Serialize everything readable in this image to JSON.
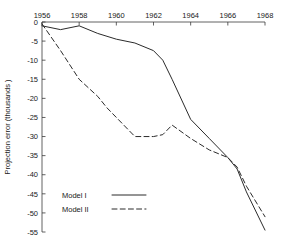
{
  "chart_data": {
    "type": "line",
    "title": "",
    "xlabel": "",
    "ylabel": "Projection  error  (thousands )",
    "xlim": [
      1956,
      1968
    ],
    "ylim": [
      -55,
      0
    ],
    "x_ticks": [
      1956,
      1958,
      1960,
      1962,
      1964,
      1966,
      1968
    ],
    "y_ticks": [
      0,
      -5,
      -10,
      -15,
      -20,
      -25,
      -30,
      -35,
      -40,
      -45,
      -50,
      -55
    ],
    "x_tick_labels": [
      "1956",
      "1958",
      "1960",
      "1962",
      "1964",
      "1966",
      "1968"
    ],
    "y_tick_labels": [
      "0",
      "-5",
      "-10",
      "-15",
      "-20",
      "-25",
      "-30",
      "-35",
      "-40",
      "-45",
      "-50",
      "-55"
    ],
    "grid": false,
    "x_axis_position": "top",
    "legend_position": "lower-left-inside",
    "series": [
      {
        "name": "Model I",
        "style": "solid",
        "color": "#2b2b2b",
        "x": [
          1956,
          1957,
          1958,
          1959,
          1960,
          1961,
          1962,
          1962.5,
          1963,
          1964,
          1965,
          1966,
          1966.5,
          1967,
          1968
        ],
        "values": [
          -1.0,
          -2.0,
          -1.0,
          -3.0,
          -4.5,
          -5.5,
          -7.5,
          -10.0,
          -15.0,
          -25.5,
          -30.5,
          -35.5,
          -38.5,
          -44.5,
          -54.5
        ]
      },
      {
        "name": "Model II",
        "style": "dashed",
        "color": "#2b2b2b",
        "x": [
          1956,
          1957,
          1958,
          1959,
          1959.5,
          1960,
          1961,
          1962,
          1962.5,
          1963,
          1964,
          1965,
          1966,
          1966.5,
          1967,
          1968
        ],
        "values": [
          -0.5,
          -7.5,
          -15.0,
          -19.5,
          -22.5,
          -25.0,
          -30.0,
          -30.0,
          -29.5,
          -27.0,
          -30.5,
          -33.5,
          -35.5,
          -38.0,
          -43.0,
          -51.0
        ]
      }
    ],
    "legend": [
      {
        "label": "Model I",
        "style": "solid"
      },
      {
        "label": "Model II",
        "style": "dashed"
      }
    ]
  }
}
